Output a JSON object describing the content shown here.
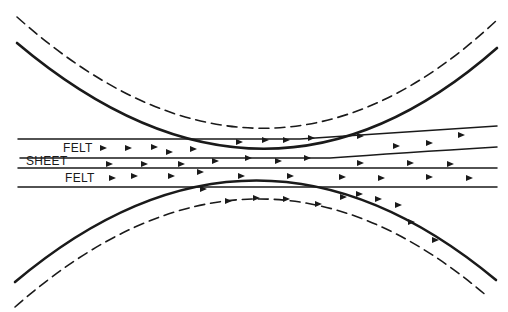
{
  "diagram": {
    "labels": {
      "felt_top": "FELT",
      "sheet": "SHEET",
      "felt_bottom": "FELT"
    },
    "colors": {
      "ink": "#1a1a1a",
      "background": "#ffffff"
    },
    "elements": [
      {
        "name": "upper-roll-surface",
        "style": "solid"
      },
      {
        "name": "upper-roll-dashed-boundary",
        "style": "dashed"
      },
      {
        "name": "lower-roll-surface",
        "style": "solid"
      },
      {
        "name": "lower-roll-dashed-boundary",
        "style": "dashed"
      },
      {
        "name": "felt-top-layer",
        "style": "lines"
      },
      {
        "name": "sheet-layer",
        "style": "lines"
      },
      {
        "name": "felt-bottom-layer",
        "style": "lines"
      },
      {
        "name": "flow-arrows",
        "style": "arrowheads"
      }
    ]
  }
}
